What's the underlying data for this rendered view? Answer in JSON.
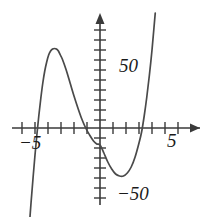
{
  "figure": {
    "name": "cubic-function-graph",
    "background_color": "#ffffff",
    "stroke_color": "#3a3a3a"
  },
  "labels": {
    "x_neg": "−5",
    "x_pos": "5",
    "y_pos": "50",
    "y_neg": "−50"
  },
  "chart_data": {
    "type": "line",
    "title": "",
    "xlabel": "",
    "ylabel": "",
    "xlim": [
      -6.2,
      6.4
    ],
    "ylim": [
      -105,
      115
    ],
    "grid": false,
    "legend": false,
    "axis_arrows": [
      "x-right",
      "y-up"
    ],
    "x_ticks": [
      -6,
      -5,
      -4,
      -3,
      -2,
      -1,
      1,
      2,
      3,
      4,
      5,
      6
    ],
    "x_tick_labels": {
      "-5": "−5",
      "5": "5"
    },
    "y_ticks": [
      -100,
      -90,
      -80,
      -70,
      -60,
      -50,
      -40,
      -30,
      -20,
      -10,
      10,
      20,
      30,
      40,
      50,
      60,
      70,
      80,
      90,
      100
    ],
    "y_tick_labels": {
      "50": "50",
      "-50": "−50"
    },
    "y_tick_interval": 10,
    "x_tick_interval": 1,
    "curve": {
      "name": "cubic",
      "x_intercepts": [
        -5.0,
        0.0,
        3.4
      ],
      "local_maximum": {
        "x": -3.4,
        "y": 78
      },
      "local_minimum": {
        "x": 1.8,
        "y": -48
      },
      "passes_through_origin": true,
      "end_behavior": {
        "left": "down",
        "right": "up"
      },
      "points": [
        [
          -5.45,
          -100
        ],
        [
          -5.3,
          -74
        ],
        [
          -5.15,
          -50
        ],
        [
          -5.0,
          -27
        ],
        [
          -4.85,
          -6
        ],
        [
          -4.7,
          13
        ],
        [
          -4.55,
          30
        ],
        [
          -4.4,
          45
        ],
        [
          -4.25,
          57
        ],
        [
          -4.1,
          66
        ],
        [
          -3.95,
          73
        ],
        [
          -3.8,
          77
        ],
        [
          -3.65,
          79
        ],
        [
          -3.5,
          79.5
        ],
        [
          -3.35,
          79
        ],
        [
          -3.2,
          77
        ],
        [
          -3.05,
          73
        ],
        [
          -2.9,
          69
        ],
        [
          -2.6,
          58
        ],
        [
          -2.3,
          45
        ],
        [
          -2.0,
          32
        ],
        [
          -1.7,
          20
        ],
        [
          -1.4,
          9
        ],
        [
          -1.1,
          0
        ],
        [
          -0.8,
          -7
        ],
        [
          -0.5,
          -13
        ],
        [
          -0.25,
          -16
        ],
        [
          0.0,
          -17
        ],
        [
          0.3,
          -25
        ],
        [
          0.6,
          -34
        ],
        [
          0.9,
          -41
        ],
        [
          1.2,
          -46
        ],
        [
          1.5,
          -48
        ],
        [
          1.8,
          -48
        ],
        [
          2.1,
          -45
        ],
        [
          2.4,
          -39
        ],
        [
          2.7,
          -29
        ],
        [
          3.0,
          -15
        ],
        [
          3.2,
          -4
        ],
        [
          3.4,
          12
        ],
        [
          3.6,
          31
        ],
        [
          3.8,
          53
        ],
        [
          4.0,
          78
        ],
        [
          4.15,
          100
        ],
        [
          4.25,
          115
        ]
      ]
    }
  }
}
